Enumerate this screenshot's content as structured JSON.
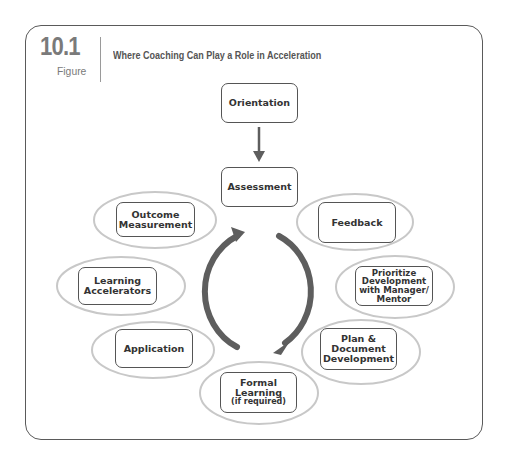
{
  "figure": {
    "number": "10.1",
    "label": "Figure",
    "title": "Where Coaching Can Play a Role in Acceleration"
  },
  "colors": {
    "frame_border": "#5a5a5a",
    "node_border": "#555555",
    "ellipse_stroke": "#c8c8c8",
    "arrow": "#5e5e5e",
    "figure_number": "#7a7a7a",
    "text": "#333333"
  },
  "nodes": {
    "orientation": "Orientation",
    "assessment": "Assessment",
    "feedback": "Feedback",
    "prioritize": "Prioritize Development with Manager/ Mentor",
    "prioritize_lines": [
      "Prioritize",
      "Development",
      "with Manager/",
      "Mentor"
    ],
    "plan_lines": [
      "Plan &",
      "Document",
      "Development"
    ],
    "formal_lines": [
      "Formal",
      "Learning"
    ],
    "formal_note": "(if required)",
    "application": "Application",
    "learning_lines": [
      "Learning",
      "Accelerators"
    ],
    "outcome_lines": [
      "Outcome",
      "Measurement"
    ]
  }
}
